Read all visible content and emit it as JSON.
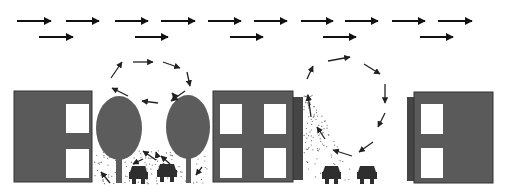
{
  "diagram": {
    "colors": {
      "background": "#ffffff",
      "building": "#5a5a5a",
      "building_shade": "#454545",
      "window": "#ffffff",
      "tree": "#5c5c5c",
      "car": "#2e2e2e",
      "arrow": "#111111",
      "pollutant": "#6a6a6a"
    },
    "wind_arrows": {
      "row1_y": 21,
      "row1": [
        [
          17,
          51
        ],
        [
          66,
          99
        ],
        [
          115,
          148
        ],
        [
          161,
          195
        ],
        [
          208,
          241
        ],
        [
          254,
          287
        ],
        [
          301,
          333
        ],
        [
          345,
          378
        ],
        [
          392,
          425
        ],
        [
          438,
          472
        ]
      ],
      "row2_y": 37,
      "row2": [
        [
          39,
          73
        ],
        [
          135,
          168
        ],
        [
          230,
          263
        ],
        [
          323,
          356
        ],
        [
          420,
          453
        ]
      ]
    },
    "buildings": [
      {
        "name": "building-left",
        "x": 14,
        "y": 91,
        "w": 78,
        "h": 91,
        "shade": null,
        "windows": [
          [
            66,
            104,
            23,
            29
          ],
          [
            66,
            149,
            23,
            29
          ]
        ]
      },
      {
        "name": "building-center",
        "x": 213,
        "y": 91,
        "w": 80,
        "h": 91,
        "shade": [
          293,
          97,
          10,
          83
        ],
        "windows": [
          [
            220,
            104,
            22,
            30
          ],
          [
            264,
            104,
            22,
            30
          ],
          [
            220,
            148,
            22,
            30
          ],
          [
            264,
            148,
            22,
            30
          ]
        ]
      },
      {
        "name": "building-right",
        "x": 414,
        "y": 92,
        "w": 79,
        "h": 91,
        "shade": [
          407,
          97,
          7,
          84
        ],
        "windows": [
          [
            421,
            104,
            22,
            30
          ],
          [
            421,
            148,
            22,
            30
          ]
        ]
      }
    ],
    "trees": [
      {
        "name": "tree-left",
        "cx": 119,
        "cy": 128,
        "rx": 23,
        "ry": 32,
        "trunk": [
          116,
          158,
          6,
          25
        ]
      },
      {
        "name": "tree-right",
        "cx": 188,
        "cy": 127,
        "rx": 22,
        "ry": 32,
        "trunk": [
          186,
          158,
          5,
          25
        ]
      }
    ],
    "cars": [
      {
        "name": "car-1",
        "x": 129,
        "y": 166,
        "w": 19
      },
      {
        "name": "car-2",
        "x": 157,
        "y": 164,
        "w": 20
      },
      {
        "name": "car-3",
        "x": 322,
        "y": 166,
        "w": 19
      },
      {
        "name": "car-4",
        "x": 357,
        "y": 166,
        "w": 20
      }
    ],
    "vortex_left_arrows": [
      [
        [
          111,
          78
        ],
        [
          122,
          62
        ]
      ],
      [
        [
          133,
          62
        ],
        [
          153,
          62
        ]
      ],
      [
        [
          163,
          62
        ],
        [
          180,
          68
        ]
      ],
      [
        [
          187,
          72
        ],
        [
          190,
          86
        ]
      ],
      [
        [
          185,
          91
        ],
        [
          171,
          101
        ]
      ],
      [
        [
          158,
          103
        ],
        [
          142,
          101
        ]
      ],
      [
        [
          128,
          96
        ],
        [
          112,
          88
        ]
      ]
    ],
    "vortex_right_arrows": [
      [
        [
          307,
          79
        ],
        [
          313,
          66
        ]
      ],
      [
        [
          328,
          61
        ],
        [
          350,
          57
        ]
      ],
      [
        [
          364,
          64
        ],
        [
          380,
          74
        ]
      ],
      [
        [
          385,
          84
        ],
        [
          385,
          103
        ]
      ],
      [
        [
          385,
          113
        ],
        [
          378,
          127
        ]
      ],
      [
        [
          373,
          142
        ],
        [
          359,
          152
        ]
      ],
      [
        [
          352,
          156
        ],
        [
          333,
          150
        ]
      ],
      [
        [
          325,
          139
        ],
        [
          317,
          127
        ]
      ],
      [
        [
          311,
          117
        ],
        [
          308,
          95
        ]
      ]
    ],
    "canyon_left_small_arrows": [
      [
        [
          110,
          183
        ],
        [
          101,
          172
        ]
      ],
      [
        [
          143,
          159
        ],
        [
          133,
          164
        ]
      ],
      [
        [
          156,
          160
        ],
        [
          143,
          151
        ]
      ],
      [
        [
          158,
          158
        ],
        [
          156,
          152
        ]
      ],
      [
        [
          170,
          164
        ],
        [
          161,
          156
        ]
      ],
      [
        [
          202,
          167
        ],
        [
          196,
          175
        ]
      ],
      [
        [
          178,
          100
        ],
        [
          172,
          93
        ]
      ]
    ]
  }
}
